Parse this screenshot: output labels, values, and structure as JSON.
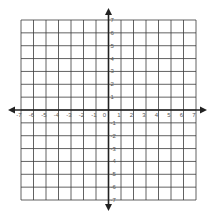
{
  "diagram": {
    "type": "coordinate-plane",
    "x_axis": {
      "min": -7,
      "max": 7,
      "ticks": [
        -7,
        -6,
        -5,
        -4,
        -3,
        -2,
        -1,
        0,
        1,
        2,
        3,
        4,
        5,
        6,
        7
      ]
    },
    "y_axis": {
      "min": -7,
      "max": 7,
      "ticks": [
        7,
        6,
        5,
        4,
        3,
        2,
        1,
        0,
        -1,
        -2,
        -3,
        -4,
        -5,
        -6,
        -7
      ]
    },
    "grid": true,
    "arrows": [
      "left",
      "right",
      "up",
      "down"
    ],
    "colors": {
      "grid": "#3a3a3a",
      "axis": "#222222",
      "label": "#555555",
      "background": "#ffffff"
    }
  }
}
